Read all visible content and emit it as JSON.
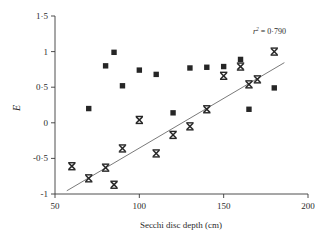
{
  "chart_data": {
    "type": "scatter",
    "title": "",
    "xlabel": "Secchi disc depth (cm)",
    "ylabel": "E",
    "xlim": [
      50,
      200
    ],
    "ylim": [
      -1,
      1.5
    ],
    "xticks": [
      50,
      100,
      150,
      200
    ],
    "xtick_labels": [
      "50",
      "100",
      "150",
      "200"
    ],
    "yticks": [
      -1,
      -0.5,
      0,
      0.5,
      1,
      1.5
    ],
    "ytick_labels": [
      "-1",
      "-0·5",
      "0",
      "0·5",
      "1",
      "1·5"
    ],
    "grid": false,
    "legend": "none",
    "annotations": [
      {
        "name": "r-squared",
        "text_prefix": "r",
        "text_sup": "2",
        "text_suffix": " = 0·790",
        "full_text": "r2 = 0·790",
        "value": 0.79,
        "x": 175,
        "y": 1.28
      }
    ],
    "series": [
      {
        "name": "squares",
        "marker": "square",
        "color": "#262626",
        "points": [
          {
            "x": 70,
            "y": 0.2
          },
          {
            "x": 80,
            "y": 0.8
          },
          {
            "x": 85,
            "y": 0.99
          },
          {
            "x": 90,
            "y": 0.52
          },
          {
            "x": 100,
            "y": 0.74
          },
          {
            "x": 110,
            "y": 0.68
          },
          {
            "x": 120,
            "y": 0.14
          },
          {
            "x": 130,
            "y": 0.77
          },
          {
            "x": 140,
            "y": 0.78
          },
          {
            "x": 150,
            "y": 0.79
          },
          {
            "x": 160,
            "y": 0.89
          },
          {
            "x": 165,
            "y": 0.19
          },
          {
            "x": 180,
            "y": 0.49
          }
        ]
      },
      {
        "name": "crosses",
        "marker": "x",
        "color": "#262626",
        "points": [
          {
            "x": 60,
            "y": -0.61
          },
          {
            "x": 70,
            "y": -0.78
          },
          {
            "x": 80,
            "y": -0.63
          },
          {
            "x": 85,
            "y": -0.87
          },
          {
            "x": 90,
            "y": -0.36
          },
          {
            "x": 100,
            "y": 0.04
          },
          {
            "x": 110,
            "y": -0.43
          },
          {
            "x": 120,
            "y": -0.17
          },
          {
            "x": 130,
            "y": -0.05
          },
          {
            "x": 140,
            "y": 0.19
          },
          {
            "x": 150,
            "y": 0.66
          },
          {
            "x": 160,
            "y": 0.79
          },
          {
            "x": 165,
            "y": 0.54
          },
          {
            "x": 170,
            "y": 0.61
          },
          {
            "x": 180,
            "y": 1.0
          }
        ]
      }
    ],
    "trendline": {
      "name": "regression-line",
      "color": "#6b6b6b",
      "x_start": 57,
      "y_start": -0.955,
      "x_end": 186,
      "y_end": 0.845
    }
  }
}
